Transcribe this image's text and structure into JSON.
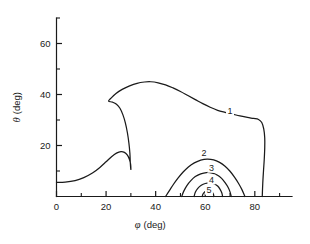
{
  "chart_data": {
    "type": "line",
    "subtype": "contour",
    "title": "",
    "xlabel": "φ (deg)",
    "ylabel": "θ (deg)",
    "xlabel_symbol": "φ",
    "xlabel_unit": "(deg)",
    "ylabel_symbol": "θ",
    "ylabel_unit": "(deg)",
    "xlim": [
      0,
      95
    ],
    "ylim": [
      0,
      70
    ],
    "xticks_major": [
      0,
      20,
      40,
      60,
      80
    ],
    "xticks_minor": [
      10,
      30,
      50,
      70,
      90
    ],
    "yticks_major": [
      20,
      40,
      60
    ],
    "yticks_minor": [
      10,
      30,
      50,
      70
    ],
    "xticklabels": [
      "0",
      "20",
      "40",
      "60",
      "80"
    ],
    "yticklabels": [
      "20",
      "40",
      "60"
    ],
    "grid": false,
    "legend": "none",
    "axes_style": "left-and-bottom-spines-only",
    "tick_direction": "in",
    "line_color": "#1a1a1a",
    "background_color": "#ffffff",
    "contours": [
      {
        "level": 1,
        "label": "1",
        "label_x": 70.0,
        "label_y": 33.5,
        "closed": false,
        "points": [
          [
            0.0,
            5.5
          ],
          [
            3.5,
            5.6
          ],
          [
            7.5,
            6.2
          ],
          [
            11.0,
            7.4
          ],
          [
            14.5,
            9.2
          ],
          [
            17.5,
            11.4
          ],
          [
            20.0,
            13.6
          ],
          [
            22.2,
            15.6
          ],
          [
            24.2,
            17.0
          ],
          [
            26.0,
            17.6
          ],
          [
            27.4,
            17.3
          ],
          [
            28.6,
            16.2
          ],
          [
            29.4,
            14.6
          ],
          [
            29.9,
            12.6
          ],
          [
            30.0,
            10.6
          ],
          [
            29.8,
            12.8
          ],
          [
            29.6,
            17.0
          ],
          [
            29.2,
            21.0
          ],
          [
            28.6,
            25.0
          ],
          [
            27.8,
            28.8
          ],
          [
            26.8,
            32.0
          ],
          [
            25.6,
            34.6
          ],
          [
            24.2,
            36.2
          ],
          [
            22.6,
            37.0
          ],
          [
            21.0,
            37.4
          ],
          [
            22.0,
            38.6
          ],
          [
            24.0,
            40.4
          ],
          [
            26.5,
            42.0
          ],
          [
            29.5,
            43.4
          ],
          [
            32.5,
            44.4
          ],
          [
            35.5,
            44.9
          ],
          [
            38.0,
            45.0
          ],
          [
            41.0,
            44.6
          ],
          [
            44.0,
            43.8
          ],
          [
            47.0,
            42.6
          ],
          [
            50.0,
            41.2
          ],
          [
            53.0,
            39.6
          ],
          [
            56.0,
            38.0
          ],
          [
            59.0,
            36.4
          ],
          [
            62.0,
            35.0
          ],
          [
            65.0,
            33.8
          ],
          [
            68.0,
            33.0
          ],
          [
            71.0,
            32.3
          ],
          [
            74.0,
            31.6
          ],
          [
            77.0,
            31.0
          ],
          [
            79.5,
            30.6
          ],
          [
            81.5,
            30.2
          ],
          [
            82.8,
            29.0
          ],
          [
            83.6,
            26.5
          ],
          [
            84.0,
            23.0
          ],
          [
            84.0,
            19.0
          ],
          [
            83.8,
            14.5
          ],
          [
            83.5,
            10.0
          ],
          [
            83.2,
            5.0
          ],
          [
            83.0,
            0.0
          ]
        ]
      },
      {
        "level": 2,
        "label": "2",
        "label_x": 59.5,
        "label_y": 17.0,
        "closed": false,
        "points": [
          [
            44.0,
            0.0
          ],
          [
            45.6,
            2.4
          ],
          [
            47.2,
            4.8
          ],
          [
            49.0,
            7.2
          ],
          [
            51.0,
            9.5
          ],
          [
            53.2,
            11.6
          ],
          [
            55.6,
            13.2
          ],
          [
            58.2,
            14.3
          ],
          [
            60.8,
            14.7
          ],
          [
            63.4,
            14.4
          ],
          [
            65.8,
            13.4
          ],
          [
            68.0,
            11.9
          ],
          [
            70.0,
            9.9
          ],
          [
            71.8,
            7.6
          ],
          [
            73.4,
            5.2
          ],
          [
            74.8,
            2.7
          ],
          [
            76.0,
            0.0
          ]
        ]
      },
      {
        "level": 3,
        "label": "3",
        "label_x": 62.5,
        "label_y": 11.2,
        "closed": false,
        "points": [
          [
            50.5,
            0.0
          ],
          [
            51.4,
            2.2
          ],
          [
            52.6,
            4.3
          ],
          [
            54.2,
            6.2
          ],
          [
            56.0,
            7.8
          ],
          [
            58.2,
            8.9
          ],
          [
            60.5,
            9.4
          ],
          [
            62.8,
            9.2
          ],
          [
            64.8,
            8.4
          ],
          [
            66.6,
            7.1
          ],
          [
            68.0,
            5.4
          ],
          [
            69.2,
            3.6
          ],
          [
            70.0,
            1.8
          ],
          [
            70.5,
            0.0
          ]
        ]
      },
      {
        "level": 4,
        "label": "4",
        "label_x": 62.5,
        "label_y": 6.6,
        "closed": false,
        "points": [
          [
            55.5,
            0.0
          ],
          [
            56.0,
            1.7
          ],
          [
            57.0,
            3.2
          ],
          [
            58.4,
            4.4
          ],
          [
            60.0,
            5.1
          ],
          [
            61.8,
            5.3
          ],
          [
            63.5,
            5.0
          ],
          [
            65.0,
            4.1
          ],
          [
            66.0,
            2.8
          ],
          [
            66.7,
            1.4
          ],
          [
            67.0,
            0.0
          ]
        ]
      },
      {
        "level": 5,
        "label": "5",
        "label_x": 61.5,
        "label_y": 2.6,
        "closed": false,
        "points": [
          [
            58.8,
            0.0
          ],
          [
            59.1,
            1.0
          ],
          [
            59.8,
            1.8
          ],
          [
            60.8,
            2.2
          ],
          [
            61.9,
            2.2
          ],
          [
            62.8,
            1.7
          ],
          [
            63.3,
            0.9
          ],
          [
            63.5,
            0.0
          ]
        ]
      }
    ]
  }
}
